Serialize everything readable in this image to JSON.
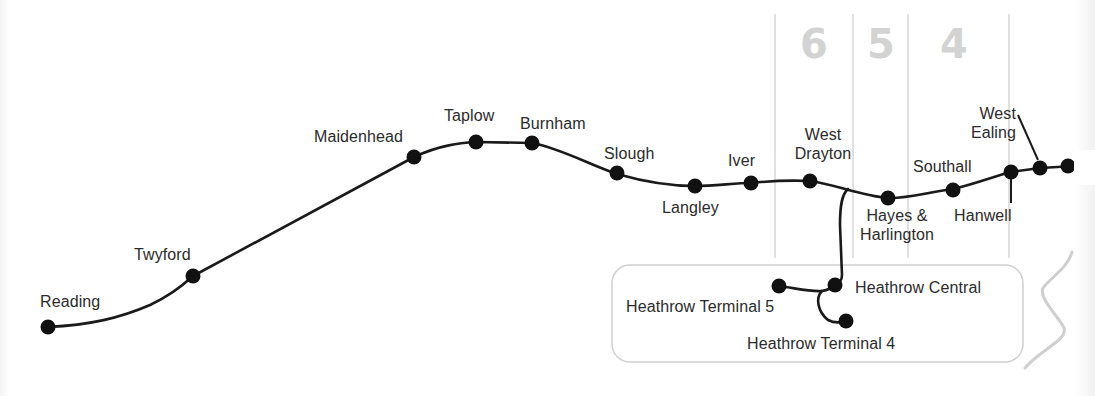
{
  "map": {
    "line_color": "#1a1a1a",
    "zone_line_color": "#d6d6d6",
    "zone_number_color": "#d3d3d3",
    "airport_box_color": "#d0d0d0",
    "zones": [
      {
        "number": "6"
      },
      {
        "number": "5"
      },
      {
        "number": "4"
      }
    ],
    "stations": [
      {
        "name": "Reading"
      },
      {
        "name": "Twyford"
      },
      {
        "name": "Maidenhead"
      },
      {
        "name": "Taplow"
      },
      {
        "name": "Burnham"
      },
      {
        "name": "Slough"
      },
      {
        "name": "Langley"
      },
      {
        "name": "Iver"
      },
      {
        "name": "West Drayton",
        "lines": [
          "West",
          "Drayton"
        ]
      },
      {
        "name": "Hayes & Harlington",
        "lines": [
          "Hayes &",
          "Harlington"
        ]
      },
      {
        "name": "Southall"
      },
      {
        "name": "Hanwell"
      },
      {
        "name": "West Ealing",
        "lines": [
          "West",
          "Ealing"
        ]
      }
    ],
    "heathrow_branch": {
      "stations": [
        {
          "name": "Heathrow Central"
        },
        {
          "name": "Heathrow Terminal 5"
        },
        {
          "name": "Heathrow Terminal 4"
        }
      ]
    }
  }
}
